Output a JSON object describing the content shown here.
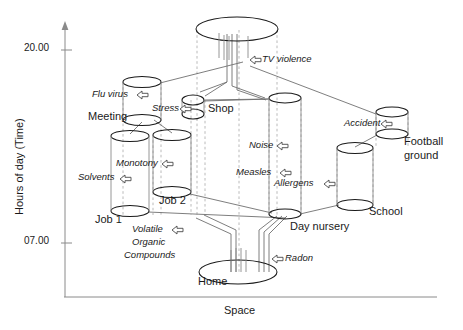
{
  "figure": {
    "type": "diagram",
    "title": "",
    "axes": {
      "y": {
        "label": "Hours of day (Time)",
        "ticks": [
          "20.00",
          "07.00"
        ]
      },
      "x": {
        "label": "Space"
      }
    },
    "places": [
      {
        "id": "media",
        "label": ""
      },
      {
        "id": "meeting",
        "label": "Meeting"
      },
      {
        "id": "shop",
        "label": "Shop"
      },
      {
        "id": "job1",
        "label": "Job 1"
      },
      {
        "id": "job2",
        "label": "Job 2"
      },
      {
        "id": "daynursery",
        "label": "Day nursery"
      },
      {
        "id": "school",
        "label": "School"
      },
      {
        "id": "footballground",
        "label": "Football\nground"
      },
      {
        "id": "home",
        "label": "Home"
      }
    ],
    "place_labels": {
      "meeting": "Meeting",
      "shop": "Shop",
      "job1": "Job 1",
      "job2": "Job 2",
      "daynursery": "Day nursery",
      "school": "School",
      "football_line1": "Football",
      "football_line2": "ground",
      "home": "Home"
    },
    "hazards": [
      {
        "id": "tv-violence",
        "label": "TV violence"
      },
      {
        "id": "flu-virus",
        "label": "Flu virus"
      },
      {
        "id": "stress",
        "label": "Stress"
      },
      {
        "id": "noise",
        "label": "Noise"
      },
      {
        "id": "accident",
        "label": "Accident"
      },
      {
        "id": "monotony",
        "label": "Monotony"
      },
      {
        "id": "solvents",
        "label": "Solvents"
      },
      {
        "id": "measles",
        "label": "Measles"
      },
      {
        "id": "allergens",
        "label": "Allergens"
      },
      {
        "id": "voc",
        "label": "Volatile\nOrganic\nCompounds"
      },
      {
        "id": "radon",
        "label": "Radon"
      }
    ],
    "hazard_labels": {
      "tv_violence": "TV violence",
      "flu_virus": "Flu virus",
      "stress": "Stress",
      "noise": "Noise",
      "accident": "Accident",
      "monotony": "Monotony",
      "solvents": "Solvents",
      "measles": "Measles",
      "allergens": "Allergens",
      "voc_line1": "Volatile",
      "voc_line2": "Organic",
      "voc_line3": "Compounds",
      "radon": "Radon"
    },
    "colors": {
      "stroke": "#1a1a1a",
      "guide": "#999999",
      "connector": "#6a6a6a",
      "background": "#ffffff"
    }
  }
}
